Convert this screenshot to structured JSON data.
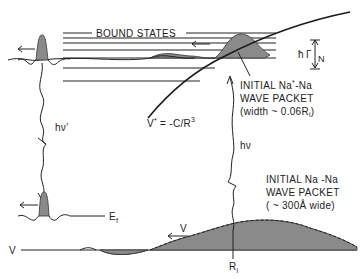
{
  "diagram": {
    "labels": {
      "bound_states": "BOUND STATES",
      "hbar": "ħ",
      "gamma_n": "Γ",
      "gamma_n_sub": "N",
      "initial_excited_1": "INITIAL Na",
      "initial_excited_sup": "*",
      "initial_excited_1b": "-Na",
      "initial_excited_2": "WAVE PACKET",
      "initial_excited_3": "(width ~ 0.06R",
      "initial_excited_3_sub": "i",
      "initial_excited_3_end": ")",
      "potential_eq_v": "V",
      "potential_eq_sup": "*",
      "potential_eq_rest": " = -C/R",
      "potential_eq_exp": "3",
      "hv_prime": "hν′",
      "hv": "hν",
      "initial_ground_1": "INITIAL Na -Na",
      "initial_ground_2": "WAVE PACKET",
      "initial_ground_3": "( ~ 300Å wide)",
      "ef": "E",
      "ef_sub": "f",
      "v_left": "V",
      "v_arrow": "V",
      "ri": "R",
      "ri_sub": "i"
    },
    "bound_state_levels_y": [
      31,
      37,
      43,
      50,
      58,
      68,
      81
    ],
    "colors": {
      "ink": "#222222",
      "shade": "#8a8a8a",
      "background": "#ffffff"
    }
  }
}
